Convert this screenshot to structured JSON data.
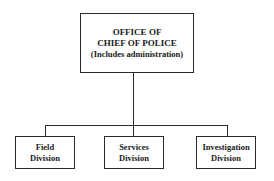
{
  "diagram": {
    "type": "org-chart",
    "root": {
      "lines": [
        "OFFICE OF",
        "CHIEF OF POLICE",
        "(Includes administration)"
      ]
    },
    "children": [
      {
        "lines": [
          "Field",
          "Division"
        ]
      },
      {
        "lines": [
          "Services",
          "Division"
        ]
      },
      {
        "lines": [
          "Investigation",
          "Division"
        ]
      }
    ]
  }
}
